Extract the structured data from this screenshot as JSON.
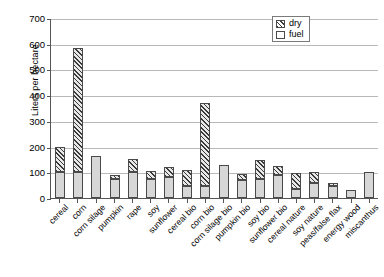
{
  "chart_data": {
    "type": "bar",
    "title": "",
    "subtitle": "",
    "xlabel": "",
    "ylabel": "Liters per hectare",
    "ylim": [
      0,
      700
    ],
    "ytick_step": 100,
    "yticks": [
      0,
      100,
      200,
      300,
      400,
      500,
      600,
      700
    ],
    "grid": true,
    "stacked": true,
    "legend_position": "top-right",
    "legend": [
      "dry",
      "fuel"
    ],
    "categories": [
      "cereal",
      "corn",
      "corn silage",
      "pumpkin",
      "rape",
      "soy",
      "sunflower",
      "cereal bio",
      "corn bio",
      "corn silage bio",
      "pumpkin bio",
      "soy bio",
      "sunflower bio",
      "cereal nature",
      "soy nature",
      "peas/false flax",
      "energy wood",
      "miscanthus"
    ],
    "series": [
      {
        "name": "fuel",
        "values": [
          100,
          100,
          163,
          75,
          100,
          75,
          82,
          45,
          45,
          128,
          72,
          75,
          88,
          35,
          60,
          45,
          30,
          100
        ]
      },
      {
        "name": "dry",
        "values": [
          98,
          485,
          0,
          15,
          50,
          32,
          38,
          65,
          325,
          0,
          22,
          72,
          37,
          62,
          40,
          12,
          0,
          0
        ]
      }
    ],
    "totals": [
      198,
      585,
      163,
      90,
      150,
      107,
      120,
      110,
      370,
      128,
      94,
      147,
      125,
      97,
      100,
      57,
      30,
      100
    ],
    "colors": {
      "fuel": "#d7d7d7",
      "dry_hatch": "#3a3a3a",
      "grid": "#b8b8b8",
      "axis": "#555555",
      "background": "#ffffff"
    }
  }
}
